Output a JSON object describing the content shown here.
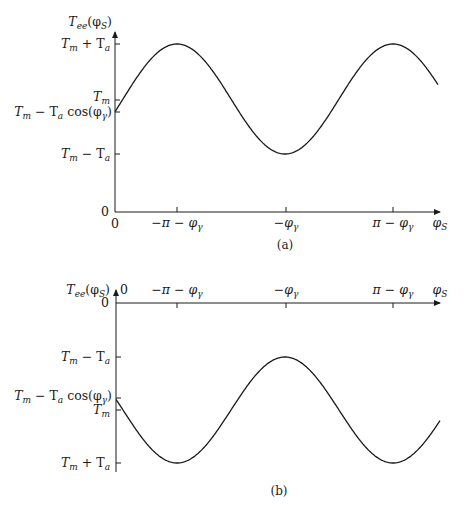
{
  "chart_data": [
    {
      "id": "a",
      "type": "line",
      "caption": "(a)",
      "ylabel": "T_ee(φ_S)",
      "xlabel": "φ_S",
      "x_origin_label": "0",
      "x_ticks": [
        {
          "label": "−π − φγ",
          "value": "-pi-phi_gamma"
        },
        {
          "label": "−φγ",
          "value": "-phi_gamma"
        },
        {
          "label": "π − φγ",
          "value": "pi-phi_gamma"
        }
      ],
      "y_ticks": [
        {
          "label": "0",
          "value": "0"
        },
        {
          "label": "Tm − Ta",
          "value": "Tm-Ta"
        },
        {
          "label": "Tm − Ta cos(φγ)",
          "value": "Tm-Ta*cos(phi_gamma)"
        },
        {
          "label": "Tm",
          "value": "Tm"
        },
        {
          "label": "Tm + Ta",
          "value": "Tm+Ta"
        }
      ],
      "function": "T_ee(φ_S) = Tm − Ta·cos(φ_S + φγ)",
      "extrema": {
        "maxima_at": [
          "-pi-phi_gamma",
          "pi-phi_gamma"
        ],
        "minima_at": [
          "-phi_gamma"
        ]
      },
      "grid": false,
      "legend": null
    },
    {
      "id": "b",
      "type": "line",
      "caption": "(b)",
      "ylabel": "T_ee(φ_S)",
      "xlabel": "φ_S",
      "x_origin_label": "0",
      "x_ticks": [
        {
          "label": "−π − φγ",
          "value": "-pi-phi_gamma"
        },
        {
          "label": "−φγ",
          "value": "-phi_gamma"
        },
        {
          "label": "π − φγ",
          "value": "pi-phi_gamma"
        }
      ],
      "y_ticks": [
        {
          "label": "0",
          "value": "0"
        },
        {
          "label": "Tm − Ta",
          "value": "Tm-Ta"
        },
        {
          "label": "Tm − Ta cos(φγ)",
          "value": "Tm-Ta*cos(phi_gamma)"
        },
        {
          "label": "Tm",
          "value": "Tm"
        },
        {
          "label": "Tm + Ta",
          "value": "Tm+Ta"
        }
      ],
      "y_axis_inverted": true,
      "function": "T_ee(φ_S) = Tm − Ta·cos(φ_S + φγ), plotted with downward-increasing (negative) axis",
      "extrema": {
        "maxima_at": [
          "-phi_gamma"
        ],
        "minima_at": [
          "-pi-phi_gamma",
          "pi-phi_gamma"
        ]
      },
      "grid": false,
      "legend": null
    }
  ],
  "labels": {
    "a": {
      "ylabel_main": "T",
      "ylabel_sub": "ee",
      "ylabel_arg_open": "(φ",
      "ylabel_arg_sub": "S",
      "ylabel_arg_close": ")",
      "tm_plus_ta": [
        "T",
        "m",
        " + T",
        "a"
      ],
      "tm": [
        "T",
        "m"
      ],
      "tm_minus_ta_cos": [
        "T",
        "m",
        " − T",
        "a",
        " cos(φ",
        "γ",
        ")"
      ],
      "tm_minus_ta": [
        "T",
        "m",
        " − T",
        "a"
      ],
      "zero_y": "0",
      "zero_x": "0",
      "xtick1": [
        "−π − φ",
        "γ"
      ],
      "xtick2": [
        "−φ",
        "γ"
      ],
      "xtick3": [
        "π − φ",
        "γ"
      ],
      "xaxis": [
        "φ",
        "S"
      ],
      "caption": "(a)"
    },
    "b": {
      "ylabel_main": "T",
      "ylabel_sub": "ee",
      "ylabel_arg_open": "(φ",
      "ylabel_arg_sub": "S",
      "ylabel_arg_close": ")",
      "zero_top": "0",
      "zero_y": "0",
      "tm_minus_ta": [
        "T",
        "m",
        " − T",
        "a"
      ],
      "tm_minus_ta_cos": [
        "T",
        "m",
        " − T",
        "a",
        " cos(φ",
        "γ",
        ")"
      ],
      "tm": [
        "T",
        "m"
      ],
      "tm_plus_ta": [
        "T",
        "m",
        " + T",
        "a"
      ],
      "xtick1": [
        "−π − φ",
        "γ"
      ],
      "xtick2": [
        "−φ",
        "γ"
      ],
      "xtick3": [
        "π − φ",
        "γ"
      ],
      "xaxis": [
        "φ",
        "S"
      ],
      "caption": "(b)"
    }
  },
  "colors": {
    "line": "#1a1a1a",
    "background": "#ffffff"
  }
}
